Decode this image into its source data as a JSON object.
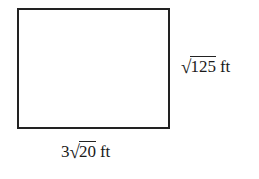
{
  "figure": {
    "shape": "rectangle",
    "stroke_color": "#222222",
    "background_color": "#ffffff"
  },
  "labels": {
    "height": {
      "coefficient": "",
      "radical_sign": "√",
      "radicand": "125",
      "unit": "ft",
      "full_text": "√125 ft"
    },
    "width": {
      "coefficient": "3",
      "radical_sign": "√",
      "radicand": "20",
      "unit": "ft",
      "full_text": "3√20 ft"
    }
  }
}
